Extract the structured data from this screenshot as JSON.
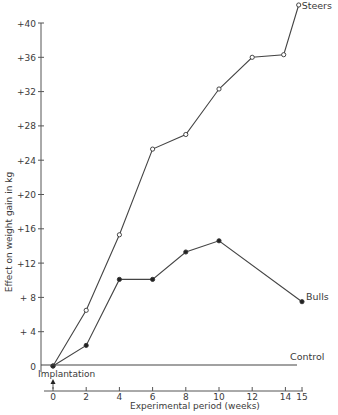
{
  "chart_data": {
    "type": "line",
    "title": "",
    "xlabel": "Experimental period (weeks)",
    "ylabel": "Effect on weight gain in kg",
    "xlim": [
      0,
      15
    ],
    "ylim": [
      0,
      40
    ],
    "x_ticks": [
      0,
      2,
      4,
      6,
      8,
      10,
      12,
      14,
      15
    ],
    "y_ticks": [
      0,
      4,
      8,
      12,
      16,
      20,
      24,
      28,
      32,
      36,
      40
    ],
    "y_tick_labels": [
      "0",
      "+ 4",
      "+ 8",
      "+12",
      "+16",
      "+20",
      "+24",
      "+28",
      "+32",
      "+36",
      "+40"
    ],
    "grid": false,
    "legend": "inline labels at line ends",
    "series": [
      {
        "name": "Steers",
        "marker": "open-circle",
        "x": [
          0,
          2,
          4,
          6,
          8,
          10,
          12,
          14,
          15
        ],
        "values": [
          0,
          6.5,
          15.3,
          25.3,
          27.0,
          32.3,
          36.0,
          36.3,
          42.1
        ]
      },
      {
        "name": "Bulls",
        "marker": "filled-circle",
        "x": [
          0,
          2,
          4,
          6,
          8,
          10,
          15
        ],
        "values": [
          0,
          2.4,
          10.1,
          10.1,
          13.3,
          14.6,
          7.5
        ]
      },
      {
        "name": "Control",
        "marker": "none",
        "x": [
          0,
          15
        ],
        "values": [
          0,
          0
        ]
      }
    ],
    "annotations": [
      {
        "text": "Implantation",
        "x": 0,
        "arrow": "up"
      }
    ]
  }
}
